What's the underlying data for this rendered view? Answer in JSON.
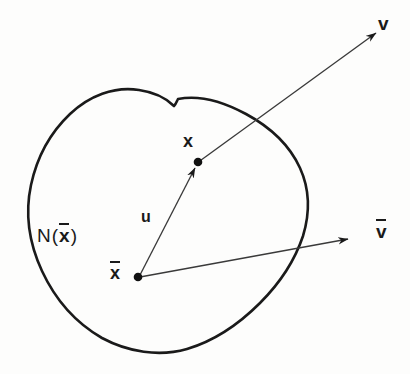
{
  "figure": {
    "type": "mathematical-diagram",
    "background_color": "#fdfdfc",
    "ink_color": "#1a1a1a",
    "width": 410,
    "height": 374,
    "labels": {
      "neighborhood": {
        "text": "N(x̄)",
        "prefix": "N",
        "open_paren": "(",
        "variable": "x",
        "overbar": true,
        "close_paren": ")",
        "x": 37,
        "y": 226
      },
      "point_x": {
        "text": "x",
        "overbar": false,
        "x": 183,
        "y": 132
      },
      "point_xbar": {
        "text": "x̄",
        "variable": "x",
        "overbar": true,
        "x": 110,
        "y": 264
      },
      "vector_u": {
        "text": "u",
        "overbar": false,
        "x": 141,
        "y": 209
      },
      "vector_v": {
        "text": "v",
        "overbar": false,
        "x": 378,
        "y": 14
      },
      "vector_vbar": {
        "text": "v̄",
        "variable": "v",
        "overbar": true,
        "x": 376,
        "y": 222
      }
    },
    "points": [
      {
        "name": "x-bar-origin",
        "x": 138,
        "y": 277,
        "radius": 4.2
      },
      {
        "name": "x-point",
        "x": 198,
        "y": 162,
        "radius": 4.2
      }
    ],
    "arrows": [
      {
        "name": "vector-u-arrow",
        "from_x": 138,
        "from_y": 277,
        "to_x": 196,
        "to_y": 165,
        "stroke_width": 1.3,
        "label": "u"
      },
      {
        "name": "vector-v-arrow",
        "from_x": 198,
        "from_y": 162,
        "to_x": 378,
        "to_y": 32,
        "stroke_width": 1.3,
        "label": "v"
      },
      {
        "name": "vector-vbar-arrow",
        "from_x": 138,
        "from_y": 277,
        "to_x": 350,
        "to_y": 238,
        "stroke_width": 1.3,
        "label": "v̄"
      }
    ],
    "region": {
      "name": "neighborhood-blob",
      "stroke_width": 2.6,
      "fill": "none",
      "notch_at": {
        "x": 178,
        "y": 99
      },
      "path": "M 178 99 C 196 96 220 100 244 112 C 268 124 289 142 300 164 C 311 186 312 210 305 233 C 298 257 282 281 262 302 C 242 323 216 341 188 349 C 160 357 128 353 102 339 C 76 325 54 300 41 272 C 28 244 25 214 30 186 C 35 158 48 133 67 115 C 86 97 112 87 138 91 C 152 93 166 98 174 105 C 176 104 177 101 178 99 Z"
    }
  }
}
